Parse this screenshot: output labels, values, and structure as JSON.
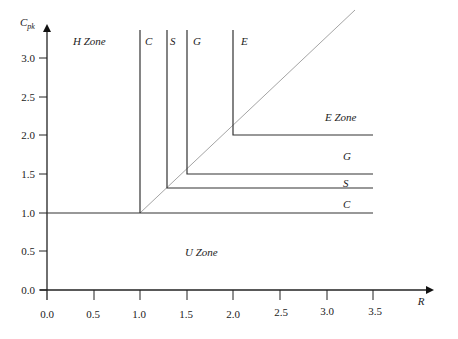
{
  "diagram": {
    "axes": {
      "x_title": "R",
      "y_title_main": "C",
      "y_title_sub": "pk",
      "x_ticks": [
        "0.0",
        "0.5",
        "1.0",
        "1.5",
        "2.0",
        "2.5",
        "3.0",
        "3.5"
      ],
      "y_ticks": [
        "0.0",
        "0.5",
        "1.0",
        "1.5",
        "2.0",
        "2.5",
        "3.0"
      ]
    },
    "zones": {
      "h_zone": "H Zone",
      "e_zone": "E Zone",
      "u_zone": "U Zone"
    },
    "top_labels": {
      "c": "C",
      "s": "S",
      "g": "G",
      "e": "E"
    },
    "right_labels": {
      "g": "G",
      "s": "S",
      "c": "C"
    },
    "thresholds": [
      {
        "name": "C",
        "value": 1.0
      },
      {
        "name": "S",
        "value": 1.33
      },
      {
        "name": "G",
        "value": 1.5
      },
      {
        "name": "E",
        "value": 2.0
      }
    ],
    "colors": {
      "axis": "#222222",
      "boundary": "#333333",
      "diagonal": "#999999"
    }
  }
}
